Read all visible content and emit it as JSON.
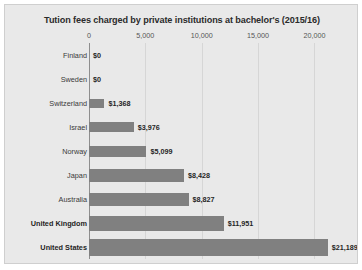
{
  "chart_data": {
    "type": "bar",
    "orientation": "horizontal",
    "title": "Tution fees charged by private institutions at bachelor's (2015/16)",
    "xlabel": "",
    "ylabel": "",
    "xlim": [
      0,
      22000
    ],
    "grid": true,
    "legend": "none",
    "xticks": [
      "0",
      "5,000",
      "10,000",
      "15,000",
      "20,000"
    ],
    "xtick_values": [
      0,
      5000,
      10000,
      15000,
      20000
    ],
    "categories": [
      "Finland",
      "Sweden",
      "Switzerland",
      "Israel",
      "Norway",
      "Japan",
      "Australia",
      "United Kingdom",
      "United States"
    ],
    "values": [
      0,
      0,
      1368,
      3976,
      5099,
      8428,
      8827,
      11951,
      21189
    ],
    "data_labels": [
      "$0",
      "$0",
      "$1,368",
      "$3,976",
      "$5,099",
      "$8,428",
      "$8,827",
      "$11,951",
      "$21,189"
    ],
    "colors": {
      "bar": "#808080",
      "background": "#e9e9e9",
      "gridline": "#d6d6d6",
      "axis": "#8e8e8e",
      "text": "#2b2b2b"
    }
  }
}
